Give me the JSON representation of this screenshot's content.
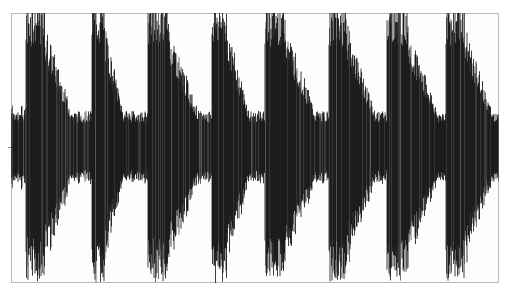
{
  "chart_data": {
    "type": "area",
    "title": "",
    "xlabel": "",
    "ylabel": "",
    "grid": false,
    "legend": null,
    "ylim": [
      -1,
      1
    ],
    "xlim": [
      0,
      1
    ],
    "onsets": [
      {
        "x": 0.03,
        "decay_end": 0.14,
        "peak": 1.0
      },
      {
        "x": 0.165,
        "decay_end": 0.24,
        "peak": 1.0
      },
      {
        "x": 0.28,
        "decay_end": 0.4,
        "peak": 1.0
      },
      {
        "x": 0.41,
        "decay_end": 0.5,
        "peak": 1.0
      },
      {
        "x": 0.52,
        "decay_end": 0.64,
        "peak": 1.0
      },
      {
        "x": 0.65,
        "decay_end": 0.76,
        "peak": 1.0
      },
      {
        "x": 0.77,
        "decay_end": 0.89,
        "peak": 1.0
      },
      {
        "x": 0.89,
        "decay_end": 1.0,
        "peak": 1.0
      }
    ],
    "colors": {
      "waveform": "#0a0a0a",
      "background": "#fdfdfd",
      "frame": "#b8b8b8"
    }
  }
}
